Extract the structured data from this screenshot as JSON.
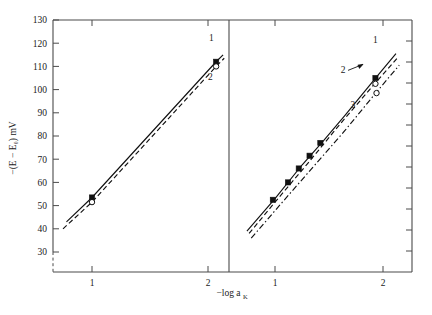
{
  "figure": {
    "background": "#ffffff",
    "ink_color": "#111111",
    "axis_color": "#4a4a4a"
  },
  "axes": {
    "y_title": "−(E − E₀) mV",
    "x_title": "−log a",
    "x_title_subscript": "K",
    "y_ticks": [
      130,
      120,
      110,
      100,
      90,
      80,
      70,
      60,
      50,
      40,
      30
    ],
    "y_tick_labels": [
      "130",
      "120",
      "110",
      "100",
      "90",
      "80",
      "70",
      "60",
      "50",
      "40",
      "30"
    ],
    "y_range": [
      26,
      130
    ],
    "axis_break": true,
    "x_ticks_left": [
      1,
      2
    ],
    "x_tick_labels_left": [
      "1",
      "2"
    ],
    "x_ticks_right": [
      1,
      2
    ],
    "x_tick_labels_right": [
      "1",
      "2"
    ],
    "right_axis_minor_ticks": 11,
    "grid": false
  },
  "chart_data": {
    "type": "line",
    "title": "",
    "xlabel": "−log a_K",
    "ylabel": "−(E − E0) mV",
    "ylim": [
      26,
      130
    ],
    "grid": false,
    "legend": "inline-curve-labels",
    "panels": [
      {
        "name": "left-panel",
        "xlim": [
          0.55,
          2.35
        ],
        "x_ticks": [
          1,
          2
        ],
        "series": [
          {
            "name": "1",
            "label": "1",
            "style": "solid",
            "marker": "filled-square",
            "x": [
              0.78,
              1.0,
              2.07,
              2.13
            ],
            "y": [
              43.0,
              53.5,
              112.0,
              115.0
            ],
            "data_points": [
              {
                "x": 1.0,
                "y": 53.5,
                "marker": "filled-square"
              },
              {
                "x": 2.07,
                "y": 112.0,
                "marker": "filled-square"
              }
            ]
          },
          {
            "name": "2",
            "label": "2",
            "style": "dashed",
            "marker": "open-circle",
            "x": [
              0.75,
              1.0,
              2.07,
              2.14
            ],
            "y": [
              40.0,
              51.5,
              110.0,
              113.5
            ],
            "data_points": [
              {
                "x": 1.0,
                "y": 51.5,
                "marker": "open-circle"
              },
              {
                "x": 2.07,
                "y": 110.0,
                "marker": "open-circle"
              }
            ]
          }
        ]
      },
      {
        "name": "right-panel",
        "xlim": [
          0.55,
          2.3
        ],
        "x_ticks": [
          1,
          2
        ],
        "series": [
          {
            "name": "1",
            "label": "1",
            "style": "solid",
            "marker": "filled-square",
            "x": [
              0.74,
              1.0,
              1.25,
              1.45,
              1.65,
              1.95,
              2.12
            ],
            "y": [
              39.0,
              53.0,
              67.5,
              78.0,
              89.0,
              106.0,
              115.5
            ],
            "data_points": [
              {
                "x": 0.98,
                "y": 52.5,
                "marker": "filled-square"
              },
              {
                "x": 1.12,
                "y": 60.0,
                "marker": "filled-square"
              },
              {
                "x": 1.22,
                "y": 66.0,
                "marker": "filled-square"
              },
              {
                "x": 1.32,
                "y": 71.5,
                "marker": "filled-square"
              },
              {
                "x": 1.42,
                "y": 77.0,
                "marker": "filled-square"
              },
              {
                "x": 1.93,
                "y": 105.0,
                "marker": "filled-square"
              }
            ]
          },
          {
            "name": "2",
            "label": "2",
            "style": "dashed",
            "marker": "open-circle",
            "x": [
              0.76,
              1.0,
              1.3,
              1.6,
              1.95,
              2.13
            ],
            "y": [
              38.0,
              51.5,
              68.0,
              85.0,
              104.0,
              113.5
            ],
            "data_points": [
              {
                "x": 1.93,
                "y": 102.5,
                "marker": "open-circle"
              }
            ]
          },
          {
            "name": "3",
            "label": "3",
            "style": "dash-dot",
            "marker": "open-circle",
            "x": [
              0.78,
              1.05,
              1.35,
              1.65,
              1.95,
              2.15
            ],
            "y": [
              36.0,
              50.5,
              66.5,
              82.5,
              99.5,
              110.5
            ],
            "data_points": [
              {
                "x": 1.94,
                "y": 98.5,
                "marker": "open-circle"
              }
            ]
          }
        ],
        "annotations": [
          {
            "text": "1",
            "x": 1.93,
            "y": 120.0,
            "kind": "curve-label"
          },
          {
            "text": "2",
            "x": 1.63,
            "y": 107.0,
            "kind": "curve-label-with-arrow"
          },
          {
            "text": "3",
            "x": 1.72,
            "y": 92.0,
            "kind": "curve-label"
          }
        ]
      }
    ],
    "left_annotations": [
      {
        "text": "1",
        "x": 2.03,
        "y": 121.0,
        "kind": "curve-label"
      },
      {
        "text": "2",
        "x": 2.02,
        "y": 104.0,
        "kind": "curve-label"
      }
    ]
  }
}
